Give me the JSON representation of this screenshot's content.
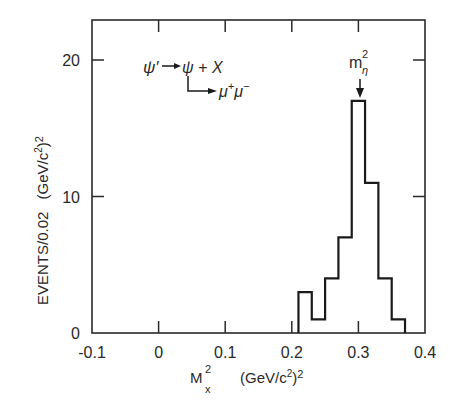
{
  "chart_data": {
    "type": "bar",
    "subtype": "histogram",
    "title": "",
    "xlabel": "M_x^2 (GeV/c^2)^2",
    "xlabel_parts": {
      "main": "M",
      "sup": "2",
      "sub": "x",
      "units": "(GeV/c",
      "units_sup": "2",
      "units_tail": ")",
      "units_tail_sup": "2"
    },
    "ylabel": "EVENTS/0.02 (GeV/c^2)^2",
    "ylabel_parts": {
      "main": "EVENTS/0.02",
      "units": "(GeV/c",
      "units_sup": "2",
      "units_tail": ")",
      "units_tail_sup": "2"
    },
    "xlim": [
      -0.1,
      0.4
    ],
    "ylim": [
      0,
      23
    ],
    "xticks": [
      -0.1,
      0,
      0.1,
      0.2,
      0.3,
      0.4
    ],
    "xtick_labels": [
      "-0.1",
      "0",
      "0.1",
      "0.2",
      "0.3",
      "0.4"
    ],
    "yticks": [
      0,
      10,
      20
    ],
    "ytick_labels": [
      "0",
      "10",
      "20"
    ],
    "bin_width": 0.02,
    "bin_edges": [
      0.21,
      0.23,
      0.25,
      0.27,
      0.29,
      0.31,
      0.33,
      0.35,
      0.37
    ],
    "categories": [
      "0.21-0.23",
      "0.23-0.25",
      "0.25-0.27",
      "0.27-0.29",
      "0.29-0.31",
      "0.31-0.33",
      "0.33-0.35",
      "0.35-0.37"
    ],
    "values": [
      3,
      1,
      4,
      7,
      17,
      11,
      4,
      1
    ],
    "grid": false,
    "legend": null,
    "annotations": [
      {
        "type": "reaction",
        "line1": "ψ′ → ψ + X",
        "line2": "↳ μ⁺μ⁻",
        "position": "upper-left"
      },
      {
        "type": "arrow-marker",
        "label": "m_η^2",
        "x": 0.3,
        "points_to_y": 17
      }
    ]
  },
  "labels": {
    "reaction_psi_prime": "ψ′",
    "reaction_psi": "ψ + X",
    "reaction_decay": "μ",
    "reaction_decay_sup1": "+",
    "reaction_decay2": "μ",
    "reaction_decay_sup2": "−",
    "marker_main": "m",
    "marker_sup": "2",
    "marker_sub": "η"
  }
}
